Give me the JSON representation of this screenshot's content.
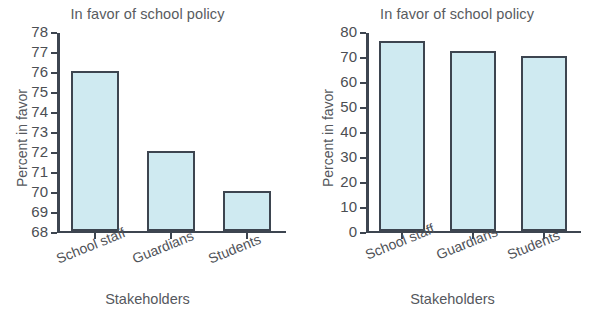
{
  "charts": [
    {
      "id": "truncated-axis-chart",
      "title": "In favor of school policy",
      "ylabel": "Percent in favor",
      "xlabel": "Stakeholders",
      "categories": [
        "School staff",
        "Guardians",
        "Students"
      ],
      "values": [
        76,
        72,
        70
      ],
      "yticks": [
        78,
        77,
        76,
        75,
        74,
        73,
        72,
        71,
        70,
        69,
        68
      ],
      "ymin": 68,
      "ymax": 78
    },
    {
      "id": "zero-baseline-chart",
      "title": "In favor of school policy",
      "ylabel": "Percent in favor",
      "xlabel": "Stakeholders",
      "categories": [
        "School staff",
        "Guardians",
        "Students"
      ],
      "values": [
        76,
        72,
        70
      ],
      "yticks": [
        80,
        70,
        60,
        50,
        40,
        30,
        20,
        10,
        0
      ],
      "ymin": 0,
      "ymax": 80
    }
  ],
  "chart_data": [
    {
      "type": "bar",
      "title": "In favor of school policy",
      "xlabel": "Stakeholders",
      "ylabel": "Percent in favor",
      "categories": [
        "School staff",
        "Guardians",
        "Students"
      ],
      "values": [
        76,
        72,
        70
      ],
      "ylim": [
        68,
        78
      ],
      "ytick_labels": [
        "68",
        "69",
        "70",
        "71",
        "72",
        "73",
        "74",
        "75",
        "76",
        "77",
        "78"
      ],
      "ytick_step": 1,
      "grid": false,
      "legend": false,
      "bar_fill": "#cfeaf1",
      "bar_edge": "#3d4550",
      "note": "Left panel: y-axis truncated at 68, exaggerating differences"
    },
    {
      "type": "bar",
      "title": "In favor of school policy",
      "xlabel": "Stakeholders",
      "ylabel": "Percent in favor",
      "categories": [
        "School staff",
        "Guardians",
        "Students"
      ],
      "values": [
        76,
        72,
        70
      ],
      "ylim": [
        0,
        80
      ],
      "ytick_labels": [
        "0",
        "10",
        "20",
        "30",
        "40",
        "50",
        "60",
        "70",
        "80"
      ],
      "ytick_step": 10,
      "grid": false,
      "legend": false,
      "bar_fill": "#cfeaf1",
      "bar_edge": "#3d4550",
      "note": "Right panel: y-axis starts at 0, differences appear small"
    }
  ],
  "colors": {
    "bar_fill": "#cfeaf1",
    "bar_edge": "#3d4550",
    "text": "#55585d",
    "background": "#ffffff"
  }
}
